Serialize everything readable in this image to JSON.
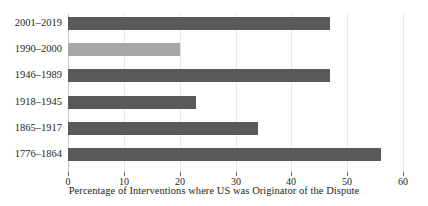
{
  "chart_data": {
    "type": "bar",
    "orientation": "horizontal",
    "title": "",
    "xlabel": "Percentage of Interventions where US was Originator of the Dispute",
    "ylabel": "",
    "categories": [
      "2001–2019",
      "1990–2000",
      "1946–1989",
      "1918–1945",
      "1865–1917",
      "1776–1864"
    ],
    "values": [
      47,
      20,
      47,
      23,
      34,
      56
    ],
    "bar_colors": [
      "#595959",
      "#a6a6a6",
      "#595959",
      "#595959",
      "#595959",
      "#595959"
    ],
    "highlight_color": "#a6a6a6",
    "default_bar_color": "#595959",
    "xlim": [
      0,
      60
    ],
    "xticks": [
      0,
      10,
      20,
      30,
      40,
      50,
      60
    ],
    "xtick_labels": [
      "0",
      "10",
      "20",
      "30",
      "40",
      "50",
      "60"
    ],
    "grid": "vertical",
    "legend": "none"
  }
}
